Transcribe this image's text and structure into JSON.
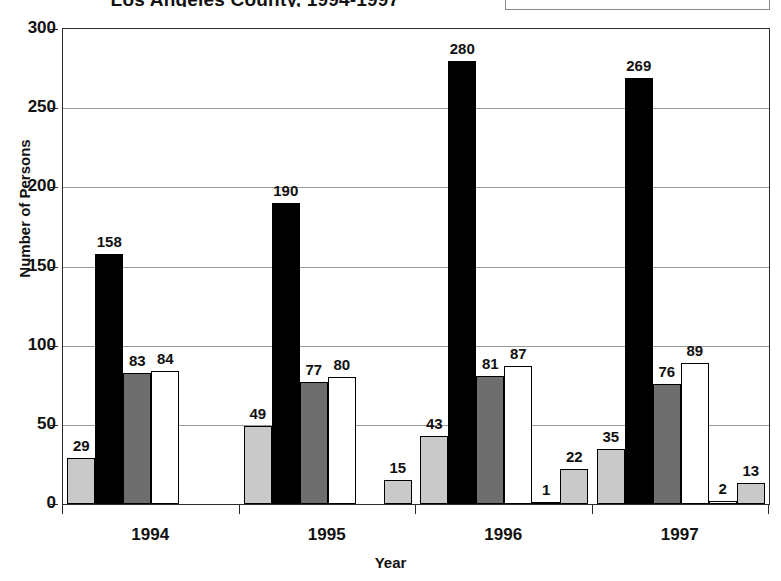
{
  "chart_data": {
    "type": "bar",
    "title": "Los Angeles County, 1994-1997",
    "xlabel": "Year",
    "ylabel": "Number of Persons",
    "categories": [
      "1994",
      "1995",
      "1996",
      "1997"
    ],
    "ylim": [
      0,
      300
    ],
    "yticks": [
      0,
      50,
      100,
      150,
      200,
      250,
      300
    ],
    "grid": true,
    "legend_position": "top-right",
    "series": [
      {
        "name": "Series 1",
        "color": "#c9c9c9",
        "values": [
          29,
          49,
          43,
          35
        ]
      },
      {
        "name": "Series 2",
        "color": "#000000",
        "values": [
          158,
          190,
          280,
          269
        ]
      },
      {
        "name": "Series 3",
        "color": "#6e6e6e",
        "values": [
          83,
          77,
          81,
          76
        ]
      },
      {
        "name": "Series 4",
        "color": "#ffffff",
        "values": [
          84,
          80,
          87,
          89
        ]
      },
      {
        "name": "Series 5",
        "color": "#ffffff",
        "values": [
          0,
          0,
          1,
          2
        ]
      },
      {
        "name": "Other",
        "color": "#c9c9c9",
        "values": [
          0,
          15,
          22,
          13
        ]
      }
    ],
    "value_labels": {
      "1994": [
        "29",
        "158",
        "83",
        "84",
        "",
        ""
      ],
      "1995": [
        "49",
        "190",
        "77",
        "80",
        "",
        "15"
      ],
      "1996": [
        "43",
        "280",
        "81",
        "87",
        "1",
        "22"
      ],
      "1997": [
        "35",
        "269",
        "76",
        "89",
        "2",
        "13"
      ]
    }
  },
  "legend": {
    "items": [
      {
        "label": "Other",
        "color": "#c9c9c9"
      }
    ]
  }
}
